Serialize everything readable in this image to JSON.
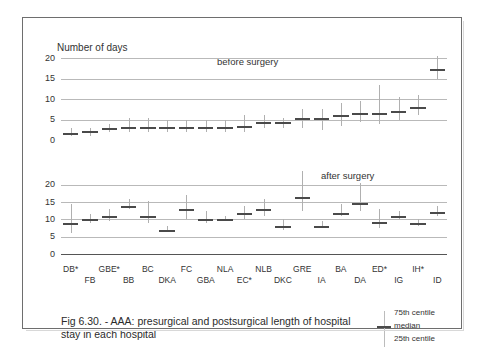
{
  "figure": {
    "caption": "Fig 6.30. - AAA: presurgical and postsurgical length of hospital stay in each hospital",
    "axis_title": "Number of days"
  },
  "legend": {
    "p75_label": "75th centile",
    "median_label": "median",
    "p25_label": "25th centile"
  },
  "chart_data": [
    {
      "type": "bar",
      "panel": "top",
      "title": "before surgery",
      "ylabel": "Number of days",
      "xlabel": "",
      "ylim": [
        0,
        22
      ],
      "yticks": [
        0,
        5,
        10,
        15,
        20
      ],
      "grid": true,
      "legend_position": "bottom-right",
      "categories": [
        "DB*",
        "FB",
        "GBE*",
        "BB",
        "BC",
        "DKA",
        "FC",
        "GBA",
        "NLA",
        "EC*",
        "NLB",
        "DKC",
        "GRE",
        "IA",
        "BA",
        "DA",
        "ED*",
        "IG",
        "IH*",
        "ID"
      ],
      "series": [
        {
          "name": "median",
          "values": [
            1.8,
            2.2,
            2.9,
            3.3,
            3.3,
            3.3,
            3.3,
            3.3,
            3.3,
            3.4,
            4.3,
            4.3,
            5.3,
            5.3,
            6.2,
            6.7,
            6.7,
            7.2,
            8.2,
            11.2
          ]
        },
        {
          "name": "25th centile",
          "values": [
            1.0,
            1.0,
            2.0,
            2.0,
            2.0,
            2.0,
            2.0,
            2.0,
            2.0,
            2.0,
            3.0,
            3.0,
            3.0,
            2.5,
            3.5,
            4.5,
            4.0,
            5.0,
            6.0,
            8.5
          ]
        },
        {
          "name": "75th centile",
          "values": [
            3.0,
            3.0,
            4.0,
            5.5,
            5.5,
            5.0,
            5.0,
            5.0,
            5.0,
            6.0,
            6.0,
            5.5,
            7.5,
            7.5,
            9.0,
            9.5,
            13.5,
            10.5,
            11.0,
            15.5
          ]
        }
      ],
      "last_point": {
        "category": "ID",
        "median": 17.5,
        "p25": 15.0,
        "p75": 20.5
      }
    },
    {
      "type": "bar",
      "panel": "bottom",
      "title": "after surgery",
      "ylabel": "Number of days",
      "xlabel": "",
      "ylim": [
        0,
        24
      ],
      "yticks": [
        0,
        5,
        10,
        15,
        20
      ],
      "grid": true,
      "legend_position": "bottom-right",
      "categories": [
        "DB*",
        "FB",
        "GBE*",
        "BB",
        "BC",
        "DKA",
        "FC",
        "GBA",
        "NLA",
        "EC*",
        "NLB",
        "DKC",
        "GRE",
        "IA",
        "BA",
        "DA",
        "ED*",
        "IG",
        "IH*",
        "ID"
      ],
      "series": [
        {
          "name": "median",
          "values": [
            9.0,
            10.0,
            11.0,
            14.0,
            11.0,
            7.0,
            13.0,
            10.1,
            10.1,
            12.0,
            13.0,
            8.0,
            16.5,
            8.0,
            12.0,
            14.7,
            9.2,
            11.1,
            9.1,
            12.1
          ]
        },
        {
          "name": "25th centile",
          "values": [
            6.0,
            9.0,
            9.5,
            13.0,
            9.0,
            6.5,
            10.0,
            9.0,
            9.5,
            10.0,
            11.0,
            7.0,
            12.5,
            7.5,
            11.0,
            12.5,
            7.5,
            10.0,
            8.0,
            11.0
          ]
        },
        {
          "name": "75th centile",
          "values": [
            14.5,
            11.5,
            13.0,
            16.0,
            15.5,
            8.0,
            17.0,
            12.5,
            11.0,
            14.0,
            16.0,
            10.0,
            24.0,
            9.5,
            14.5,
            20.5,
            13.0,
            12.5,
            10.0,
            14.0
          ]
        }
      ]
    }
  ],
  "x_labels_row1": [
    "DB*",
    "GBE*",
    "BC",
    "FC",
    "NLA",
    "NLB",
    "GRE",
    "BA",
    "ED*",
    "IH*"
  ],
  "x_labels_row2": [
    "FB",
    "BB",
    "DKA",
    "GBA",
    "EC*",
    "DKC",
    "IA",
    "DA",
    "IG",
    "ID"
  ],
  "colors": {
    "median": "#4a4a4a",
    "whisker": "#b0b0b0",
    "grid": "#b9b9b9",
    "axis": "#555555",
    "frame": "#6e6e6e",
    "text": "#2b2b2b"
  }
}
